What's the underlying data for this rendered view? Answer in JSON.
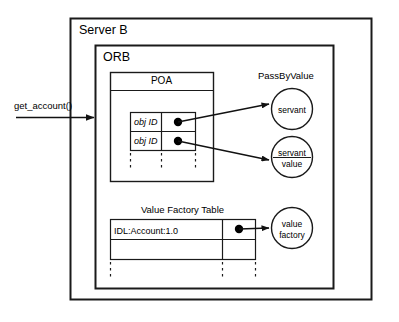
{
  "diagram": {
    "title_outer": "Server B",
    "title_inner": "ORB",
    "incoming_call": "get_account()",
    "poa": {
      "header": "POA",
      "rows": [
        {
          "id": "obj ID",
          "pointer": "dot"
        },
        {
          "id": "obj ID",
          "pointer": "dot"
        }
      ],
      "continuation": "dashed"
    },
    "value_factory_table": {
      "title": "Value Factory Table",
      "rows": [
        {
          "repository_id": "IDL:Account:1.0",
          "pointer": "dot"
        },
        {
          "repository_id": "",
          "pointer": ""
        }
      ],
      "continuation": "dashed"
    },
    "pass_by_value": {
      "label": "PassByValue",
      "nodes": [
        {
          "name": "servant",
          "line1": "servant",
          "line2": "",
          "divider": false
        },
        {
          "name": "servant-value",
          "line1": "servant",
          "line2": "value",
          "divider": true
        }
      ]
    },
    "value_factory_node": {
      "name": "value-factory",
      "line1": "value",
      "line2": "factory",
      "divider": false
    },
    "colors": {
      "stroke": "#1a1a1a",
      "background": "#ffffff",
      "dot": "#000000"
    }
  }
}
